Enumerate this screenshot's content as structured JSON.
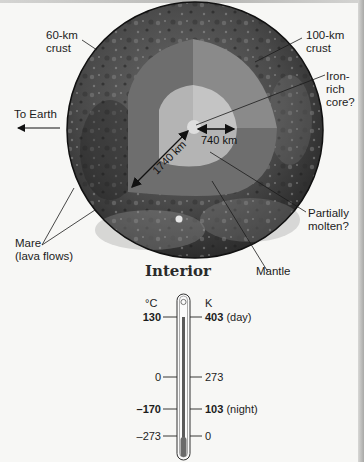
{
  "diagram": {
    "title": "Interior",
    "colors": {
      "background": "#f7f7f5",
      "surface_dark": "#3a3a3a",
      "mantle_dark": "#6e6e6e",
      "mantle_light": "#8a8a8a",
      "molten_zone": "#b4b4b4",
      "molten_zone_light": "#c4c4c4",
      "core": "#dedede",
      "label_text": "#1c1c1c"
    },
    "labels": {
      "crust_near": "60-km",
      "crust_near_2": "crust",
      "crust_far": "100-km",
      "crust_far_2": "crust",
      "core_1": "Iron-",
      "core_2": "rich",
      "core_3": "core?",
      "to_earth": "To Earth",
      "radius_total": "1740 km",
      "radius_molten": "740 km",
      "molten_1": "Partially",
      "molten_2": "molten?",
      "mare_1": "Mare",
      "mare_2": "(lava flows)",
      "mantle": "Mantle"
    }
  },
  "thermometer": {
    "celsius_header": "°C",
    "kelvin_header": "K",
    "rows": [
      {
        "celsius": "130",
        "kelvin": "403",
        "note": "(day)",
        "bold": true
      },
      {
        "celsius": "0",
        "kelvin": "273",
        "note": "",
        "bold": false
      },
      {
        "celsius": "–170",
        "kelvin": "103",
        "note": "(night)",
        "bold": true
      },
      {
        "celsius": "–273",
        "kelvin": "0",
        "note": "",
        "bold": false
      }
    ]
  }
}
